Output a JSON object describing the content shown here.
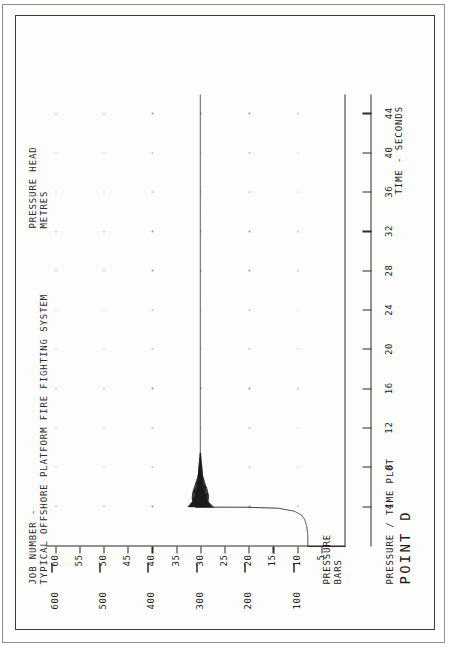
{
  "document": {
    "kind": "scanned-engineering-chart",
    "header_line_1": "JOB NUMBER -",
    "header_line_2": "TYPICAL OFFSHORE PLATFORM FIRE FIGHTING SYSTEM",
    "right_header_line_1": "PRESSURE HEAD",
    "right_header_line_2": "METRES",
    "footer_caption": "PRESSURE / TIME PLOT",
    "footer_point": "POINT D"
  },
  "axes": {
    "y_left_label_line_1": "PRESSURE",
    "y_left_label_line_2": "BARS",
    "y_right_label_line_1": "PRESSURE HEAD",
    "y_right_label_line_2": "METRES",
    "x_label": "TIME - SECONDS"
  },
  "chart_data": {
    "type": "line",
    "title": "TYPICAL OFFSHORE PLATFORM FIRE FIGHTING SYSTEM",
    "subtitle": "PRESSURE / TIME PLOT  POINT D",
    "xlabel": "TIME - SECONDS",
    "ylabel": "PRESSURE BARS",
    "y2label": "PRESSURE HEAD METRES",
    "xlim": [
      0,
      46
    ],
    "ylim": [
      0,
      62
    ],
    "y2lim": [
      0,
      620
    ],
    "grid": "dotted-marks",
    "legend": "none",
    "xticks": [
      4,
      8,
      12,
      16,
      20,
      24,
      28,
      32,
      36,
      40,
      44
    ],
    "xticklabels": [
      "4",
      "8",
      "12",
      "16",
      "20",
      "24",
      "28",
      "32",
      "36",
      "40",
      "44"
    ],
    "yticks": [
      5,
      10,
      15,
      20,
      25,
      30,
      35,
      40,
      45,
      50,
      55,
      60
    ],
    "yticklabels": [
      "5",
      "10",
      "15",
      "20",
      "25",
      "30",
      "35",
      "40",
      "45",
      "50",
      "55",
      "60"
    ],
    "y2ticks": [
      100,
      200,
      300,
      400,
      500,
      600
    ],
    "y2ticklabels": [
      "100",
      "200",
      "300",
      "400",
      "500",
      "600"
    ],
    "series": [
      {
        "name": "Pressure at Point D",
        "units": "bar",
        "x": [
          0.0,
          0.4,
          0.8,
          1.2,
          1.6,
          2.0,
          2.4,
          2.8,
          3.2,
          3.6,
          3.9,
          4.0,
          4.05,
          4.1,
          4.2,
          4.3,
          4.5,
          4.7,
          4.9,
          5.2,
          5.5,
          5.9,
          6.3,
          6.8,
          7.3,
          7.9,
          8.5,
          9.2,
          10.0,
          11.0,
          12.5,
          14.0,
          16.0,
          18.0,
          20.0,
          24.0,
          28.0,
          32.0,
          36.0,
          40.0,
          44.0,
          45.5
        ],
        "y": [
          7.8,
          7.8,
          7.8,
          7.8,
          7.9,
          8.0,
          8.2,
          8.5,
          9.1,
          10.6,
          14.0,
          21.0,
          26.0,
          27.4,
          27.8,
          28.0,
          28.3,
          28.6,
          28.9,
          29.1,
          29.3,
          29.5,
          29.7,
          29.8,
          29.9,
          30.0,
          30.0,
          30.0,
          30.0,
          30.0,
          30.0,
          30.0,
          30.0,
          30.0,
          30.0,
          30.0,
          30.0,
          30.0,
          30.0,
          30.0,
          30.0,
          30.0
        ],
        "oscillation": {
          "present": true,
          "start_time_s": 4.0,
          "end_time_s": 9.5,
          "centre_bar": 30.0,
          "initial_amplitude_bar": 2.6,
          "decay": "exponential",
          "description": "high-frequency damped pressure surge ringing immediately after valve opening"
        },
        "notes": [
          "Static line pressure before event: 7.8 bar",
          "Sharp rise at t = 4 s",
          "Damped oscillation settles to steady-state 30 bar (approx. 300 m head)"
        ]
      }
    ]
  }
}
